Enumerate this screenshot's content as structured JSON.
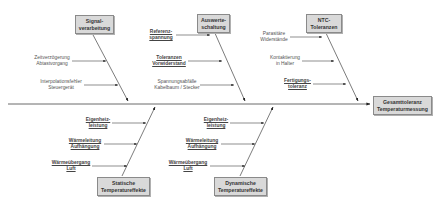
{
  "effect": {
    "line1": "Gesamttoleranz",
    "line2": "Temperaturmessung"
  },
  "categories": [
    {
      "id": "signal",
      "line1": "Signal-",
      "line2": "verarbeitung",
      "causes": [
        {
          "line1": "Zeitverzögerung",
          "line2": "Abtastvorgang",
          "underlined": false
        },
        {
          "line1": "Interpolationsfehler",
          "line2": "Steuergerät",
          "underlined": false
        }
      ]
    },
    {
      "id": "auswerte",
      "line1": "Auswerte-",
      "line2": "schaltung",
      "causes": [
        {
          "line1": "Referenz-",
          "line2": "spannung",
          "underlined": true
        },
        {
          "line1": "Toleranzen",
          "line2": "Vorwiderstand",
          "underlined": true
        },
        {
          "line1": "Spannungsabfälle",
          "line2": "Kabelbaum / Stecker",
          "underlined": false
        }
      ]
    },
    {
      "id": "ntc",
      "line1": "NTC-",
      "line2": "Toleranzen",
      "causes": [
        {
          "line1": "Parasitäre",
          "line2": "Widerstände",
          "underlined": false
        },
        {
          "line1": "Kontaktierung",
          "line2": "in Halter",
          "underlined": false
        },
        {
          "line1": "Fertigungs-",
          "line2": "toleranz",
          "underlined": true
        }
      ]
    },
    {
      "id": "statisch",
      "line1": "Statische",
      "line2": "Temperatureffekte",
      "causes": [
        {
          "line1": "Eigenheiz-",
          "line2": "leistung",
          "underlined": true
        },
        {
          "line1": "Wärmeleitung",
          "line2": "Aufhängung",
          "underlined": true
        },
        {
          "line1": "Wärmeübergang",
          "line2": "Luft",
          "underlined": true
        }
      ]
    },
    {
      "id": "dynamisch",
      "line1": "Dynamische",
      "line2": "Temperatureffekte",
      "causes": [
        {
          "line1": "Eigenheiz-",
          "line2": "leistung",
          "underlined": true
        },
        {
          "line1": "Wärmeleitung",
          "line2": "Aufhängung",
          "underlined": true
        },
        {
          "line1": "Wärmeübergang",
          "line2": "Luft",
          "underlined": true
        }
      ]
    }
  ],
  "colors": {
    "box_fill": "#d9d9d9",
    "box_border": "#8a8a8a",
    "line": "#333333"
  }
}
